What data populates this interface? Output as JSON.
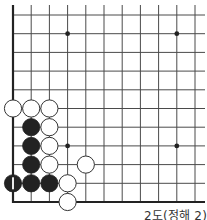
{
  "diagram": {
    "type": "go-board-fragment",
    "caption": "2도(정해 2)",
    "colors": {
      "line": "#4a4a4a",
      "edge": "#222222",
      "black_stone": "#222222",
      "white_stone": "#ffffff",
      "stone_outline": "#333333",
      "star_point": "#222222"
    },
    "grid": {
      "columns": 11,
      "rows": 11,
      "origin_x": 13,
      "origin_y": 15,
      "spacing_x": 18.2,
      "spacing_y": 18.7,
      "left_edge": true,
      "bottom_edge": true,
      "extends_right": true,
      "extends_top": true
    },
    "star_points": [
      {
        "col": 3,
        "row": 1
      },
      {
        "col": 9,
        "row": 1
      },
      {
        "col": 3,
        "row": 7
      },
      {
        "col": 9,
        "row": 7
      }
    ],
    "stones": [
      {
        "color": "white",
        "col": 0,
        "row": 5
      },
      {
        "color": "white",
        "col": 1,
        "row": 5
      },
      {
        "color": "white",
        "col": 2,
        "row": 5
      },
      {
        "color": "black",
        "col": 1,
        "row": 6
      },
      {
        "color": "white",
        "col": 2,
        "row": 6
      },
      {
        "color": "black",
        "col": 1,
        "row": 7
      },
      {
        "color": "white",
        "col": 2,
        "row": 7
      },
      {
        "color": "black",
        "col": 1,
        "row": 8
      },
      {
        "color": "white",
        "col": 2,
        "row": 8
      },
      {
        "color": "white",
        "col": 4,
        "row": 8
      },
      {
        "color": "black",
        "col": 0,
        "row": 9,
        "label": "1"
      },
      {
        "color": "black",
        "col": 1,
        "row": 9
      },
      {
        "color": "black",
        "col": 2,
        "row": 9
      },
      {
        "color": "white",
        "col": 3,
        "row": 9
      },
      {
        "color": "white",
        "col": 3,
        "row": 10
      }
    ]
  }
}
